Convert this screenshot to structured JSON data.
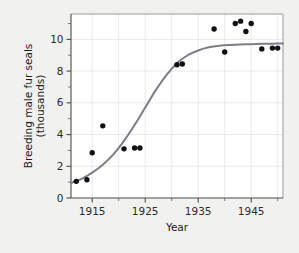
{
  "chart_data": {
    "type": "scatter",
    "title": "",
    "xlabel": "Year",
    "ylabel": "Breeding male fur seals (thousands)",
    "ylabel_line1": "Breeding male fur seals",
    "ylabel_line2": "(thousands)",
    "xlim": [
      1911,
      1951
    ],
    "ylim": [
      0,
      11.6
    ],
    "grid": true,
    "legend": null,
    "x_ticks_major": [
      1915,
      1925,
      1935,
      1945
    ],
    "x_tick_labels": [
      "1915",
      "1925",
      "1935",
      "1945"
    ],
    "x_ticks_minor": [
      1920,
      1930,
      1940,
      1950
    ],
    "y_ticks_major": [
      0,
      2,
      4,
      6,
      8,
      10
    ],
    "y_tick_labels": [
      "0",
      "2",
      "4",
      "6",
      "8",
      "10"
    ],
    "y_ticks_minor": [
      1,
      3,
      5,
      7,
      9,
      11
    ],
    "point_color": "#111111",
    "curve_color": "#7d7d86",
    "series": [
      {
        "name": "Breeding male fur seals",
        "x": [
          1912,
          1914,
          1915,
          1917,
          1921,
          1923,
          1924,
          1931,
          1932,
          1938,
          1940,
          1942,
          1943,
          1944,
          1945,
          1947,
          1949,
          1950
        ],
        "y": [
          1.05,
          1.15,
          2.85,
          4.55,
          3.1,
          3.15,
          3.15,
          8.4,
          8.45,
          10.65,
          9.2,
          11.0,
          11.15,
          10.5,
          11.0,
          9.4,
          9.45,
          9.45
        ]
      }
    ],
    "fit_curve": {
      "name": "logistic fit",
      "x": [
        1911,
        1913,
        1915,
        1917,
        1919,
        1921,
        1923,
        1925,
        1927,
        1929,
        1931,
        1933,
        1935,
        1937,
        1939,
        1941,
        1943,
        1945,
        1947,
        1949,
        1951
      ],
      "y": [
        0.95,
        1.2,
        1.6,
        2.1,
        2.75,
        3.6,
        4.6,
        5.7,
        6.8,
        7.75,
        8.5,
        9.0,
        9.3,
        9.5,
        9.6,
        9.65,
        9.68,
        9.7,
        9.72,
        9.73,
        9.74
      ]
    }
  },
  "layout": {
    "plot_left": 71,
    "plot_right": 283,
    "plot_top": 14,
    "plot_bottom": 198
  }
}
